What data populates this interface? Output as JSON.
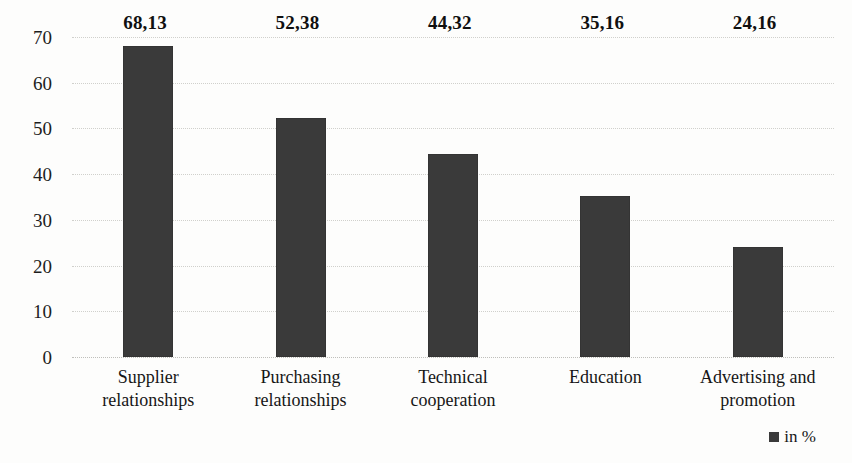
{
  "chart_data": {
    "type": "bar",
    "title": "",
    "subtitle": "",
    "xlabel": "",
    "ylabel": "",
    "ylim": [
      0,
      70
    ],
    "yticks": [
      0,
      10,
      20,
      30,
      40,
      50,
      60,
      70
    ],
    "ytick_labels": [
      "0",
      "10",
      "20",
      "30",
      "40",
      "50",
      "60",
      "70"
    ],
    "grid": true,
    "grid_axis": "y",
    "legend_position": "bottom-right",
    "value_decimal_separator": ",",
    "categories": [
      "Supplier relationships",
      "Purchasing relationships",
      "Technical cooperation",
      "Education",
      "Advertising and promotion"
    ],
    "category_lines": [
      [
        "Supplier",
        "relationships"
      ],
      [
        "Purchasing",
        "relationships"
      ],
      [
        "Technical",
        "cooperation"
      ],
      [
        "Education"
      ],
      [
        "Advertising and",
        "promotion"
      ]
    ],
    "values": [
      68.13,
      52.38,
      44.32,
      35.16,
      24.16
    ],
    "value_labels": [
      "68,13",
      "52,38",
      "44,32",
      "35,16",
      "24,16"
    ],
    "series": [
      {
        "name": "in %",
        "color": "#3a3a3a",
        "values": [
          68.13,
          52.38,
          44.32,
          35.16,
          24.16
        ]
      }
    ],
    "legend": [
      {
        "label": "in %",
        "color": "#3a3a3a",
        "marker": "square"
      }
    ]
  },
  "colors": {
    "bar": "#3a3a3a",
    "gridline": "#c9c9c4",
    "text": "#161616",
    "background": "#fdfdfc"
  }
}
